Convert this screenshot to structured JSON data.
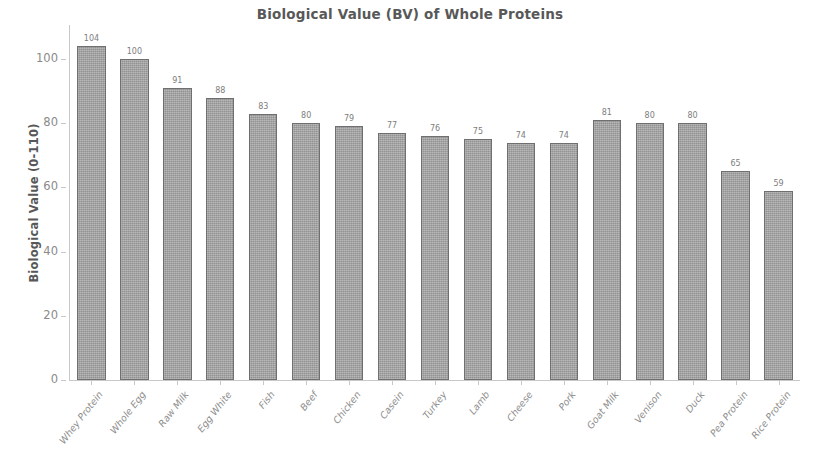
{
  "chart_data": {
    "type": "bar",
    "title": "Biological Value (BV) of Whole Proteins",
    "xlabel": "",
    "ylabel": "Biological Value (0-110)",
    "ylim": [
      0,
      110
    ],
    "yticks": [
      0,
      20,
      40,
      60,
      80,
      100
    ],
    "grid": false,
    "legend": null,
    "bar_color": "#a3a3a3",
    "bar_edge_color": "#6f6f6f",
    "value_labels": true,
    "categories": [
      "Whey Protein",
      "Whole Egg",
      "Raw Milk",
      "Egg White",
      "Fish",
      "Beef",
      "Chicken",
      "Casein",
      "Turkey",
      "Lamb",
      "Cheese",
      "Pork",
      "Goat Milk",
      "Venison",
      "Duck",
      "Pea Protein",
      "Rice Protein"
    ],
    "values": [
      104,
      100,
      91,
      88,
      83,
      80,
      79,
      77,
      76,
      75,
      74,
      74,
      81,
      80,
      80,
      65,
      59
    ]
  }
}
